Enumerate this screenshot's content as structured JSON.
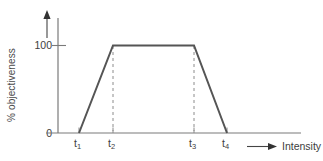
{
  "chart_data": {
    "type": "line",
    "title": "",
    "xlabel": "Intensity",
    "ylabel": "% objectiveness",
    "ytick_labels": [
      "0",
      "100"
    ],
    "ytick_values": [
      0,
      100
    ],
    "xtick_labels": [
      "t1",
      "t2",
      "t3",
      "t4"
    ],
    "xtick_display": [
      "t",
      "t",
      "t",
      "t"
    ],
    "xtick_subscripts": [
      "1",
      "2",
      "3",
      "4"
    ],
    "ylim": [
      0,
      115
    ],
    "grid": false,
    "legend": null,
    "series": [
      {
        "name": "objectiveness",
        "shape": "trapezoid",
        "points": [
          {
            "x": "t1",
            "y": 0
          },
          {
            "x": "t2",
            "y": 100
          },
          {
            "x": "t3",
            "y": 100
          },
          {
            "x": "t4",
            "y": 0
          }
        ]
      }
    ],
    "annotations": [
      {
        "type": "dashed-vertical",
        "at": "t2",
        "from": 0,
        "to": 100
      },
      {
        "type": "dashed-vertical",
        "at": "t3",
        "from": 0,
        "to": 100
      }
    ],
    "axis_arrows": {
      "x": "right-arrow",
      "y": "up-arrow"
    }
  },
  "axis": {
    "y_label": "% objectiveness",
    "y_tick_top": "100",
    "y_tick_bottom": "0",
    "x_label": "Intensity"
  },
  "ticks": [
    {
      "base": "t",
      "sub": "1"
    },
    {
      "base": "t",
      "sub": "2"
    },
    {
      "base": "t",
      "sub": "3"
    },
    {
      "base": "t",
      "sub": "4"
    }
  ],
  "colors": {
    "line": "#555555",
    "axis": "#7a7a7a",
    "dashed": "#8c8c8c",
    "text": "#3d3d3d",
    "background": "#ffffff"
  }
}
